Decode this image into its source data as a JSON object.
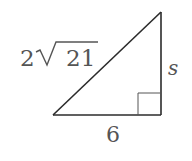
{
  "diagram": {
    "type": "right-triangle",
    "vertices": {
      "bottom_left": [
        53,
        115
      ],
      "bottom_right": [
        161,
        115
      ],
      "top": [
        161,
        12
      ]
    },
    "right_angle_at": "bottom_right",
    "labels": {
      "hypotenuse": {
        "coefficient": "2",
        "radicand": "21",
        "text": "2√21"
      },
      "vertical_side": "s",
      "base": "6"
    },
    "colors": {
      "lines": "#2b2b2b",
      "text": "#555555",
      "background": "#ffffff"
    }
  }
}
